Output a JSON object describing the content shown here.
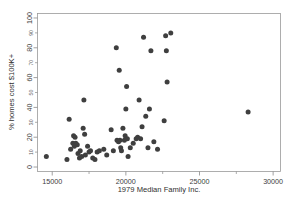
{
  "chart_data": {
    "type": "scatter",
    "title": "",
    "xlabel": "1979 Median Family Inc.",
    "ylabel": "% homes cost $100K+",
    "xlim": [
      14000,
      30500
    ],
    "ylim": [
      -3,
      103
    ],
    "grid": false,
    "legend": null,
    "x_ticks_major": [
      "15000",
      "20000",
      "25000",
      "30000"
    ],
    "x_ticks_major_values": [
      15000,
      20000,
      25000,
      30000
    ],
    "y_ticks_major": [
      "0",
      "20",
      "40",
      "60",
      "80",
      "100"
    ],
    "y_ticks_major_values": [
      0,
      20,
      40,
      60,
      80,
      100
    ],
    "y_ticks_minor": [
      "10",
      "30",
      "50",
      "70",
      "90"
    ],
    "y_ticks_minor_values": [
      10,
      30,
      50,
      70,
      90
    ],
    "marker": {
      "shape": "circle",
      "color": "#3f3f3f",
      "size_px": 5.0
    },
    "n_points": 62,
    "points": [
      {
        "x": 14600,
        "y": 7
      },
      {
        "x": 16000,
        "y": 5
      },
      {
        "x": 16150,
        "y": 32
      },
      {
        "x": 16250,
        "y": 12
      },
      {
        "x": 16400,
        "y": 16
      },
      {
        "x": 16450,
        "y": 21
      },
      {
        "x": 16500,
        "y": 14
      },
      {
        "x": 16550,
        "y": 20
      },
      {
        "x": 16600,
        "y": 16
      },
      {
        "x": 16700,
        "y": 15
      },
      {
        "x": 16750,
        "y": 9
      },
      {
        "x": 16850,
        "y": 6
      },
      {
        "x": 16900,
        "y": 11
      },
      {
        "x": 17000,
        "y": 7
      },
      {
        "x": 17100,
        "y": 26
      },
      {
        "x": 17150,
        "y": 45
      },
      {
        "x": 17200,
        "y": 22
      },
      {
        "x": 17250,
        "y": 8
      },
      {
        "x": 17400,
        "y": 14
      },
      {
        "x": 17500,
        "y": 10
      },
      {
        "x": 17600,
        "y": 11
      },
      {
        "x": 17750,
        "y": 6
      },
      {
        "x": 17900,
        "y": 5
      },
      {
        "x": 18050,
        "y": 10
      },
      {
        "x": 18200,
        "y": 11
      },
      {
        "x": 18500,
        "y": 12
      },
      {
        "x": 18700,
        "y": 8
      },
      {
        "x": 19000,
        "y": 25
      },
      {
        "x": 19150,
        "y": 11
      },
      {
        "x": 19350,
        "y": 80
      },
      {
        "x": 19400,
        "y": 18
      },
      {
        "x": 19500,
        "y": 17
      },
      {
        "x": 19550,
        "y": 65
      },
      {
        "x": 19600,
        "y": 18
      },
      {
        "x": 19650,
        "y": 13
      },
      {
        "x": 19700,
        "y": 11
      },
      {
        "x": 19800,
        "y": 26
      },
      {
        "x": 19900,
        "y": 18
      },
      {
        "x": 19950,
        "y": 21
      },
      {
        "x": 20000,
        "y": 39
      },
      {
        "x": 20050,
        "y": 54
      },
      {
        "x": 20100,
        "y": 19
      },
      {
        "x": 20150,
        "y": 7
      },
      {
        "x": 20300,
        "y": 13
      },
      {
        "x": 20500,
        "y": 16
      },
      {
        "x": 20700,
        "y": 19
      },
      {
        "x": 20800,
        "y": 20
      },
      {
        "x": 20900,
        "y": 45
      },
      {
        "x": 21000,
        "y": 19
      },
      {
        "x": 21100,
        "y": 27
      },
      {
        "x": 21200,
        "y": 87
      },
      {
        "x": 21350,
        "y": 34
      },
      {
        "x": 21500,
        "y": 13
      },
      {
        "x": 21600,
        "y": 39
      },
      {
        "x": 21700,
        "y": 78
      },
      {
        "x": 21900,
        "y": 17
      },
      {
        "x": 22150,
        "y": 12
      },
      {
        "x": 22600,
        "y": 31
      },
      {
        "x": 22700,
        "y": 88
      },
      {
        "x": 22750,
        "y": 78
      },
      {
        "x": 22800,
        "y": 57
      },
      {
        "x": 23050,
        "y": 90
      },
      {
        "x": 28300,
        "y": 37
      }
    ]
  },
  "axes": {
    "x_title": "1979 Median Family Inc.",
    "y_title": "% homes cost $100K+"
  }
}
